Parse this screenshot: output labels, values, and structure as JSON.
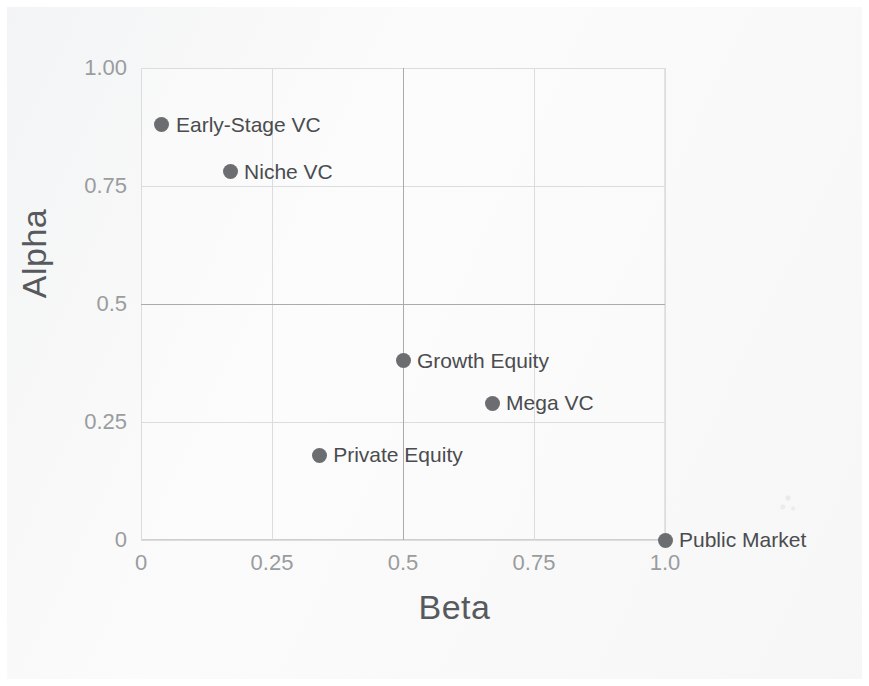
{
  "chart_data": {
    "type": "scatter",
    "title": "",
    "xlabel": "Beta",
    "ylabel": "Alpha",
    "xlim": [
      0,
      1.0
    ],
    "ylim": [
      0,
      1.0
    ],
    "xticks": [
      "0",
      "0.25",
      "0.5",
      "0.75",
      "1.0"
    ],
    "xtick_values": [
      0,
      0.25,
      0.5,
      0.75,
      1.0
    ],
    "yticks": [
      "0",
      "0.25",
      "0.5",
      "0.75",
      "1.00"
    ],
    "ytick_values": [
      0,
      0.25,
      0.5,
      0.75,
      1.0
    ],
    "grid": true,
    "legend": "none",
    "quadrant_lines": {
      "x": 0.5,
      "y": 0.5
    },
    "point_color": "#6b6d70",
    "label_color": "#4a4c4f",
    "grid_color": "#dadcde",
    "quadrant_line_color": "#a9abad",
    "tick_color": "#9a9c9e",
    "background_color": "#fbfbfb",
    "points": [
      {
        "label": "Early-Stage VC",
        "x": 0.04,
        "y": 0.88,
        "label_side": "right"
      },
      {
        "label": "Niche VC",
        "x": 0.17,
        "y": 0.78,
        "label_side": "right"
      },
      {
        "label": "Growth Equity",
        "x": 0.5,
        "y": 0.38,
        "label_side": "right"
      },
      {
        "label": "Mega VC",
        "x": 0.67,
        "y": 0.29,
        "label_side": "right"
      },
      {
        "label": "Private Equity",
        "x": 0.34,
        "y": 0.18,
        "label_side": "right"
      },
      {
        "label": "Public Market",
        "x": 1.0,
        "y": 0.0,
        "label_side": "right"
      }
    ]
  }
}
